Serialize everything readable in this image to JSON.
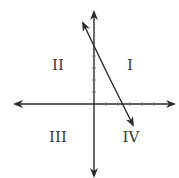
{
  "diagram": {
    "type": "coordinate-plane",
    "quadrant_labels": {
      "q1": "I",
      "q2": "II",
      "q3": "III",
      "q4": "IV"
    },
    "line": {
      "description": "line with negative slope crossing positive y-axis and positive x-axis",
      "y_intercept_approx": 4.5,
      "x_intercept_approx": 2.5
    },
    "colors": {
      "axis": "#2b2b2b",
      "line": "#2b2b2b",
      "label": "#3a3a3a"
    }
  }
}
